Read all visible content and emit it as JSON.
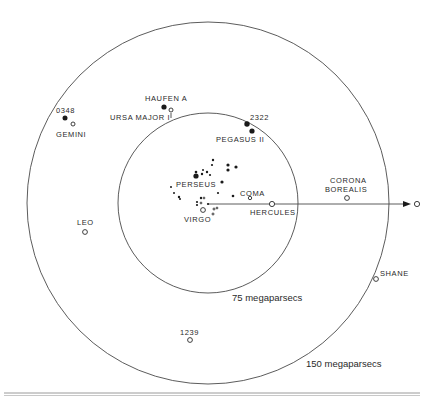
{
  "diagram": {
    "title": "",
    "center": {
      "x": 208,
      "y": 203
    },
    "rings": [
      {
        "label": "75 megaparsecs",
        "radius": 90
      },
      {
        "label": "150 megaparsecs",
        "radius": 181
      }
    ],
    "clusters": {
      "haufen_a": "HAUFEN A",
      "ursa_major": "URSA MAJOR I",
      "c0348": "0348",
      "gemini": "GEMINI",
      "c2322": "2322",
      "pegasus": "PEGASUS II",
      "perseus": "PERSEUS",
      "coma": "COMA",
      "virgo": "VIRGO",
      "hercules": "HERCULES",
      "corona_borealis_1": "CORONA",
      "corona_borealis_2": "BOREALIS",
      "leo": "LEO",
      "shane": "SHANE",
      "c1239": "1239"
    },
    "legend": {
      "solid_marker": "filled-circle",
      "open_marker": "open-circle"
    },
    "arrow": {
      "direction": "right",
      "end_marker": "open-circle"
    }
  }
}
